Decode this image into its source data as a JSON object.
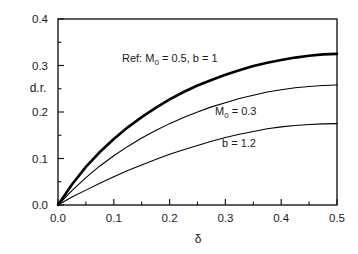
{
  "chart_data": {
    "type": "line",
    "title": "",
    "xlabel": "δ",
    "ylabel": "d.r.",
    "xlim": [
      0.0,
      0.5
    ],
    "ylim": [
      0.0,
      0.4
    ],
    "xticks": [
      "0.0",
      "0.1",
      "0.2",
      "0.3",
      "0.4",
      "0.5"
    ],
    "xtick_values": [
      0.0,
      0.1,
      0.2,
      0.3,
      0.4,
      0.5
    ],
    "yticks": [
      "0.0",
      "0.1",
      "0.2",
      "0.3",
      "0.4"
    ],
    "ytick_values": [
      0.0,
      0.1,
      0.2,
      0.3,
      0.4
    ],
    "minor_ticks": true,
    "grid": false,
    "legend_position": "inline-annotations",
    "x": [
      0.0,
      0.025,
      0.05,
      0.075,
      0.1,
      0.125,
      0.15,
      0.175,
      0.2,
      0.225,
      0.25,
      0.275,
      0.3,
      0.325,
      0.35,
      0.375,
      0.4,
      0.425,
      0.45,
      0.475,
      0.5
    ],
    "series": [
      {
        "name": "Ref: M0 = 0.5, b = 1",
        "label_text": "Ref:  M",
        "label_sub": "0",
        "label_rest": " = 0.5, b = 1",
        "linewidth": "thick",
        "color": "#000000",
        "values": [
          0.0,
          0.044,
          0.082,
          0.114,
          0.142,
          0.167,
          0.189,
          0.209,
          0.227,
          0.243,
          0.257,
          0.269,
          0.28,
          0.29,
          0.299,
          0.306,
          0.312,
          0.317,
          0.321,
          0.324,
          0.325
        ]
      },
      {
        "name": "M0 = 0.3",
        "label_text": "M",
        "label_sub": "0",
        "label_rest": " = 0.3",
        "linewidth": "thin",
        "color": "#000000",
        "values": [
          0.0,
          0.031,
          0.059,
          0.084,
          0.106,
          0.126,
          0.144,
          0.16,
          0.175,
          0.188,
          0.2,
          0.211,
          0.22,
          0.229,
          0.236,
          0.243,
          0.248,
          0.252,
          0.255,
          0.257,
          0.258
        ]
      },
      {
        "name": "b = 1.2",
        "label_text": "b = 1.2",
        "label_sub": "",
        "label_rest": "",
        "linewidth": "thin",
        "color": "#000000",
        "values": [
          0.0,
          0.017,
          0.032,
          0.047,
          0.061,
          0.074,
          0.086,
          0.098,
          0.109,
          0.119,
          0.128,
          0.137,
          0.145,
          0.152,
          0.158,
          0.164,
          0.168,
          0.171,
          0.173,
          0.1745,
          0.175
        ]
      }
    ],
    "annotations": [
      {
        "id": "ref-annotation",
        "text": "Ref:  M0 = 0.5, b = 1",
        "x_px": 122,
        "y_px": 62
      },
      {
        "id": "m0-annotation",
        "text": "M0 = 0.3",
        "x_px": 215,
        "y_px": 115
      },
      {
        "id": "b-annotation",
        "text": "b = 1.2",
        "x_px": 222,
        "y_px": 147
      }
    ],
    "colors": {
      "axis": "#1a1a1a",
      "curve": "#000000",
      "background": "#ffffff"
    }
  }
}
